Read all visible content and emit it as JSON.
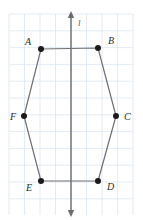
{
  "figure": {
    "background_color": "#ffffff",
    "grid": {
      "color": "#dce6f0",
      "line_width": 0.8,
      "spacing_x": 15.5,
      "spacing_y": 16.8,
      "x_start": 9,
      "x_end": 133,
      "y_start": 14,
      "y_end": 215,
      "visible": true
    },
    "axis": {
      "name": "l",
      "label": "l",
      "label_x": 78,
      "label_y": 26,
      "color": "#6b6b70",
      "line_width": 1.4,
      "x": 71,
      "y_top": 16,
      "y_bottom": 212,
      "arrow_top": true,
      "arrow_bottom": true
    },
    "polygon": {
      "name": "hexagon",
      "stroke_color": "#6f6f74",
      "stroke_width": 1.2,
      "fill": "none",
      "closed": true,
      "vertex_order": [
        "A",
        "B",
        "C",
        "D",
        "E",
        "F"
      ]
    },
    "point_style": {
      "color": "#1a1a1a",
      "radius": 3.0
    },
    "points": [
      {
        "label": "A",
        "x": 41,
        "y": 49,
        "label_x": 31,
        "label_y": 45,
        "label_anchor": "end"
      },
      {
        "label": "B",
        "x": 98,
        "y": 48,
        "label_x": 108,
        "label_y": 44,
        "label_anchor": "start"
      },
      {
        "label": "C",
        "x": 116,
        "y": 116,
        "label_x": 124,
        "label_y": 120,
        "label_anchor": "start"
      },
      {
        "label": "D",
        "x": 98,
        "y": 181,
        "label_x": 107,
        "label_y": 190,
        "label_anchor": "start"
      },
      {
        "label": "E",
        "x": 41,
        "y": 181,
        "label_x": 32,
        "label_y": 191,
        "label_anchor": "end"
      },
      {
        "label": "F",
        "x": 24,
        "y": 116,
        "label_x": 16,
        "label_y": 120,
        "label_anchor": "end"
      }
    ]
  }
}
